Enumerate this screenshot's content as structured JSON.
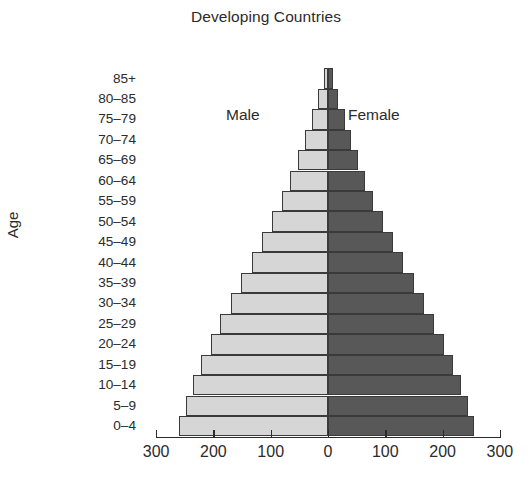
{
  "chart_data": {
    "type": "bar",
    "subtype": "population-pyramid",
    "title": "Developing Countries",
    "xlabel": "",
    "ylabel": "Age",
    "categories": [
      "0–4",
      "5–9",
      "10–14",
      "15–19",
      "20–24",
      "25–29",
      "30–34",
      "35–39",
      "40–44",
      "45–49",
      "50–54",
      "55–59",
      "60–64",
      "65–69",
      "70–74",
      "75–79",
      "80–85",
      "85+"
    ],
    "series": [
      {
        "name": "Male",
        "side": "left",
        "color": "#d6d6d6",
        "values": [
          260,
          248,
          235,
          222,
          205,
          188,
          170,
          152,
          133,
          115,
          98,
          80,
          66,
          52,
          40,
          28,
          17,
          7
        ]
      },
      {
        "name": "Female",
        "side": "right",
        "color": "#585858",
        "values": [
          255,
          244,
          232,
          218,
          202,
          185,
          167,
          150,
          131,
          113,
          96,
          79,
          65,
          52,
          40,
          29,
          18,
          8
        ]
      }
    ],
    "xticks": [
      300,
      200,
      100,
      0,
      100,
      200,
      300
    ],
    "xlim": [
      -300,
      300
    ],
    "grid": false,
    "legend_position": "inside-top",
    "units": "millions"
  },
  "axis": {
    "y_title": "Age",
    "tick_labels": [
      "300",
      "200",
      "100",
      "0",
      "100",
      "200",
      "300"
    ]
  },
  "legend": {
    "male": "Male",
    "female": "Female"
  }
}
